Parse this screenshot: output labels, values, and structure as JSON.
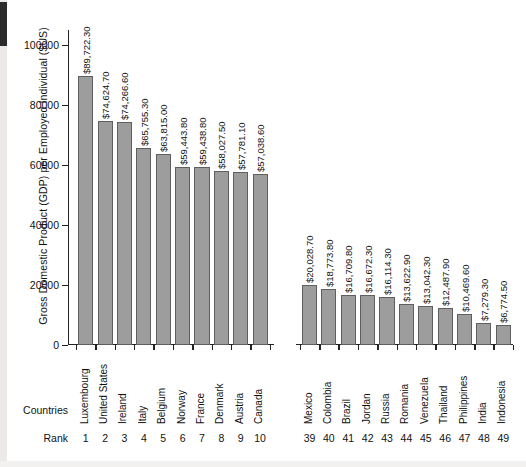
{
  "figure": {
    "y_axis_title": "Gross Domestic Product (GDP) per Employed Individual ($US)",
    "countries_axis_title": "Countries",
    "rank_axis_title": "Rank",
    "bar_fill_color": "#9d9d9d",
    "bar_edge_color": "#5f5f5f",
    "axis_color": "#222222"
  },
  "chart_data": {
    "type": "bar",
    "title": "",
    "xlabel": "Countries",
    "ylabel": "Gross Domestic Product (GDP) per Employed Individual ($US)",
    "ylim": [
      0,
      105000
    ],
    "yticks": [
      0,
      20000,
      40000,
      60000,
      80000,
      100000
    ],
    "ytick_labels": [
      "0",
      "20000",
      "40000",
      "60000",
      "80000",
      "100000"
    ],
    "grid": false,
    "legend": "none",
    "axis_break": true,
    "axis_break_after_index": 9,
    "categories": [
      "Luxembourg",
      "United States",
      "Ireland",
      "Italy",
      "Belgium",
      "Norway",
      "France",
      "Denmark",
      "Austria",
      "Canada",
      "Mexico",
      "Colombia",
      "Brazil",
      "Jordan",
      "Russia",
      "Romania",
      "Venezuela",
      "Thailand",
      "Philippines",
      "India",
      "Indonesia"
    ],
    "ranks": [
      1,
      2,
      3,
      4,
      5,
      6,
      7,
      8,
      9,
      10,
      39,
      40,
      41,
      42,
      43,
      44,
      45,
      46,
      47,
      48,
      49
    ],
    "values": [
      89722.3,
      74624.7,
      74266.6,
      65755.3,
      63815.0,
      59443.8,
      59438.8,
      58027.5,
      57781.1,
      57038.6,
      20028.7,
      18773.8,
      16709.8,
      16672.3,
      16114.3,
      13622.9,
      13042.3,
      12487.9,
      10469.6,
      7279.3,
      6774.5
    ],
    "value_labels": [
      "$89,722.30",
      "$74,624.70",
      "$74,266.60",
      "$65,755.30",
      "$63,815.00",
      "$59,443.80",
      "$59,438.80",
      "$58,027.50",
      "$57,781.10",
      "$57,038.60",
      "$20,028.70",
      "$18,773.80",
      "$16,709.80",
      "$16,672.30",
      "$16,114.30",
      "$13,622.90",
      "$13,042.30",
      "$12,487.90",
      "$10,469.60",
      "$7,279.30",
      "$6,774.50"
    ]
  }
}
